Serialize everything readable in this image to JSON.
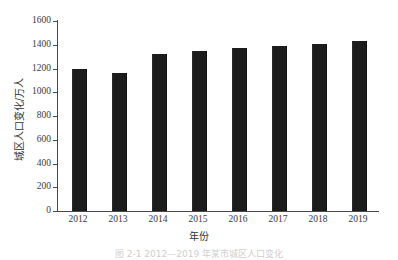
{
  "chart_data": {
    "type": "bar",
    "title": "",
    "subtitle": "",
    "xlabel": "年份",
    "ylabel": "城区人口变化/万人",
    "categories": [
      "2012",
      "2013",
      "2014",
      "2015",
      "2016",
      "2017",
      "2018",
      "2019"
    ],
    "values": [
      1200,
      1165,
      1320,
      1345,
      1375,
      1390,
      1405,
      1430
    ],
    "series": [
      {
        "name": "城区人口变化",
        "values": [
          1200,
          1165,
          1320,
          1345,
          1375,
          1390,
          1405,
          1430
        ]
      }
    ],
    "ylim": [
      0,
      1600
    ],
    "ytick_labels": [
      "0",
      "200",
      "400",
      "600",
      "800",
      "1000",
      "1200",
      "1400",
      "1600"
    ],
    "ytick_values": [
      0,
      200,
      400,
      600,
      800,
      1000,
      1200,
      1400,
      1600
    ],
    "grid": false,
    "legend": null,
    "legend_position": "none",
    "bar_color": "#1c1c1c",
    "axis_color": "#4a4a4a",
    "background_color": "#ffffff",
    "annotations": []
  },
  "figure": {
    "caption": "图 2-1   2012—2019 年某市城区人口变化"
  }
}
